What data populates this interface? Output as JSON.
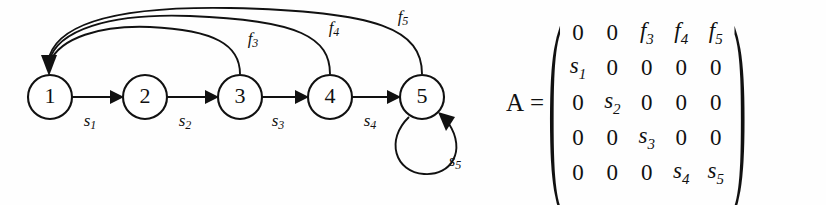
{
  "figure": {
    "background_color": "#fefefe",
    "ink_color": "#111111"
  },
  "diagram": {
    "nodes": [
      {
        "id": "node-1",
        "label": "1",
        "cx": 50,
        "cy": 97,
        "r": 22
      },
      {
        "id": "node-2",
        "label": "2",
        "cx": 145,
        "cy": 97,
        "r": 22
      },
      {
        "id": "node-3",
        "label": "3",
        "cx": 240,
        "cy": 97,
        "r": 22
      },
      {
        "id": "node-4",
        "label": "4",
        "cx": 330,
        "cy": 97,
        "r": 22
      },
      {
        "id": "node-5",
        "label": "5",
        "cx": 422,
        "cy": 97,
        "r": 22
      }
    ],
    "survival_edges": [
      {
        "id": "edge-s1",
        "from": "1",
        "to": "2",
        "base": "s",
        "sub": "1",
        "label_x": 90,
        "label_y": 126
      },
      {
        "id": "edge-s2",
        "from": "2",
        "to": "3",
        "base": "s",
        "sub": "2",
        "label_x": 185,
        "label_y": 126
      },
      {
        "id": "edge-s3",
        "from": "3",
        "to": "4",
        "base": "s",
        "sub": "3",
        "label_x": 278,
        "label_y": 126
      },
      {
        "id": "edge-s4",
        "from": "4",
        "to": "5",
        "base": "s",
        "sub": "4",
        "label_x": 370,
        "label_y": 126
      },
      {
        "id": "edge-s5",
        "from": "5",
        "to": "5",
        "base": "s",
        "sub": "5",
        "label_x": 455,
        "label_y": 166
      }
    ],
    "fecundity_edges": [
      {
        "id": "edge-f3",
        "from": "3",
        "to": "1",
        "base": "f",
        "sub": "3",
        "label_x": 253,
        "label_y": 44
      },
      {
        "id": "edge-f4",
        "from": "4",
        "to": "1",
        "base": "f",
        "sub": "4",
        "label_x": 334,
        "label_y": 33
      },
      {
        "id": "edge-f5",
        "from": "5",
        "to": "1",
        "base": "f",
        "sub": "5",
        "label_x": 403,
        "label_y": 22
      }
    ]
  },
  "matrix": {
    "name": "A",
    "equals": "=",
    "left_bracket": "(",
    "right_bracket": ")",
    "rows": [
      [
        {
          "t": "0",
          "v": false
        },
        {
          "t": "0",
          "v": false
        },
        {
          "t": "f",
          "s": "3",
          "v": true
        },
        {
          "t": "f",
          "s": "4",
          "v": true
        },
        {
          "t": "f",
          "s": "5",
          "v": true
        }
      ],
      [
        {
          "t": "s",
          "s": "1",
          "v": true
        },
        {
          "t": "0",
          "v": false
        },
        {
          "t": "0",
          "v": false
        },
        {
          "t": "0",
          "v": false
        },
        {
          "t": "0",
          "v": false
        }
      ],
      [
        {
          "t": "0",
          "v": false
        },
        {
          "t": "s",
          "s": "2",
          "v": true
        },
        {
          "t": "0",
          "v": false
        },
        {
          "t": "0",
          "v": false
        },
        {
          "t": "0",
          "v": false
        }
      ],
      [
        {
          "t": "0",
          "v": false
        },
        {
          "t": "0",
          "v": false
        },
        {
          "t": "s",
          "s": "3",
          "v": true
        },
        {
          "t": "0",
          "v": false
        },
        {
          "t": "0",
          "v": false
        }
      ],
      [
        {
          "t": "0",
          "v": false
        },
        {
          "t": "0",
          "v": false
        },
        {
          "t": "0",
          "v": false
        },
        {
          "t": "s",
          "s": "4",
          "v": true
        },
        {
          "t": "s",
          "s": "5",
          "v": true
        }
      ]
    ],
    "cells_flat": [
      "0",
      "0",
      "f3",
      "f4",
      "f5",
      "s1",
      "0",
      "0",
      "0",
      "0",
      "0",
      "s2",
      "0",
      "0",
      "0",
      "0",
      "0",
      "s3",
      "0",
      "0",
      "0",
      "0",
      "0",
      "s4",
      "s5"
    ]
  }
}
